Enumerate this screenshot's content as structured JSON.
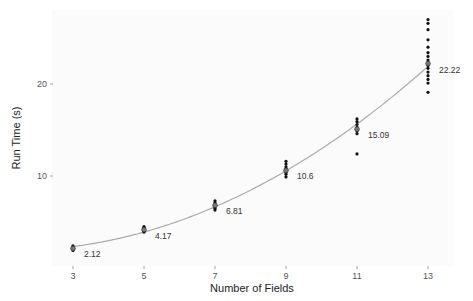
{
  "chart_data": {
    "type": "scatter",
    "title": "",
    "xlabel": "Number of Fields",
    "ylabel": "Run Time (s)",
    "x_ticks": [
      3,
      5,
      7,
      9,
      11,
      13
    ],
    "y_ticks": [
      10,
      20
    ],
    "xlim": [
      2.5,
      13.8
    ],
    "ylim": [
      0,
      27.5
    ],
    "grid": false,
    "legend": null,
    "fit_line": {
      "type": "smooth",
      "color": "#aaaaaa"
    },
    "means": [
      {
        "x": 3,
        "y": 2.12,
        "label": "2.12"
      },
      {
        "x": 5,
        "y": 4.17,
        "label": "4.17"
      },
      {
        "x": 7,
        "y": 6.81,
        "label": "6.81"
      },
      {
        "x": 9,
        "y": 10.6,
        "label": "10.6"
      },
      {
        "x": 11,
        "y": 15.09,
        "label": "15.09"
      },
      {
        "x": 13,
        "y": 22.22,
        "label": "22.22"
      }
    ],
    "observations": [
      {
        "x": 3,
        "y": [
          1.9,
          2.0,
          2.1,
          2.15,
          2.2,
          2.3,
          2.4
        ]
      },
      {
        "x": 5,
        "y": [
          3.9,
          4.0,
          4.1,
          4.2,
          4.3,
          4.4,
          4.5
        ]
      },
      {
        "x": 7,
        "y": [
          6.3,
          6.5,
          6.7,
          6.8,
          6.9,
          7.1,
          7.3
        ]
      },
      {
        "x": 9,
        "y": [
          9.9,
          10.2,
          10.4,
          10.6,
          10.8,
          11.0,
          11.3,
          11.6
        ]
      },
      {
        "x": 11,
        "y": [
          12.4,
          14.6,
          14.9,
          15.1,
          15.3,
          15.6,
          15.9,
          16.2
        ]
      },
      {
        "x": 13,
        "y": [
          19.1,
          20.1,
          20.5,
          20.9,
          21.3,
          21.7,
          22.0,
          22.3,
          22.6,
          23.0,
          23.4,
          24.0,
          24.8,
          25.9,
          26.6,
          27.0
        ]
      }
    ]
  }
}
